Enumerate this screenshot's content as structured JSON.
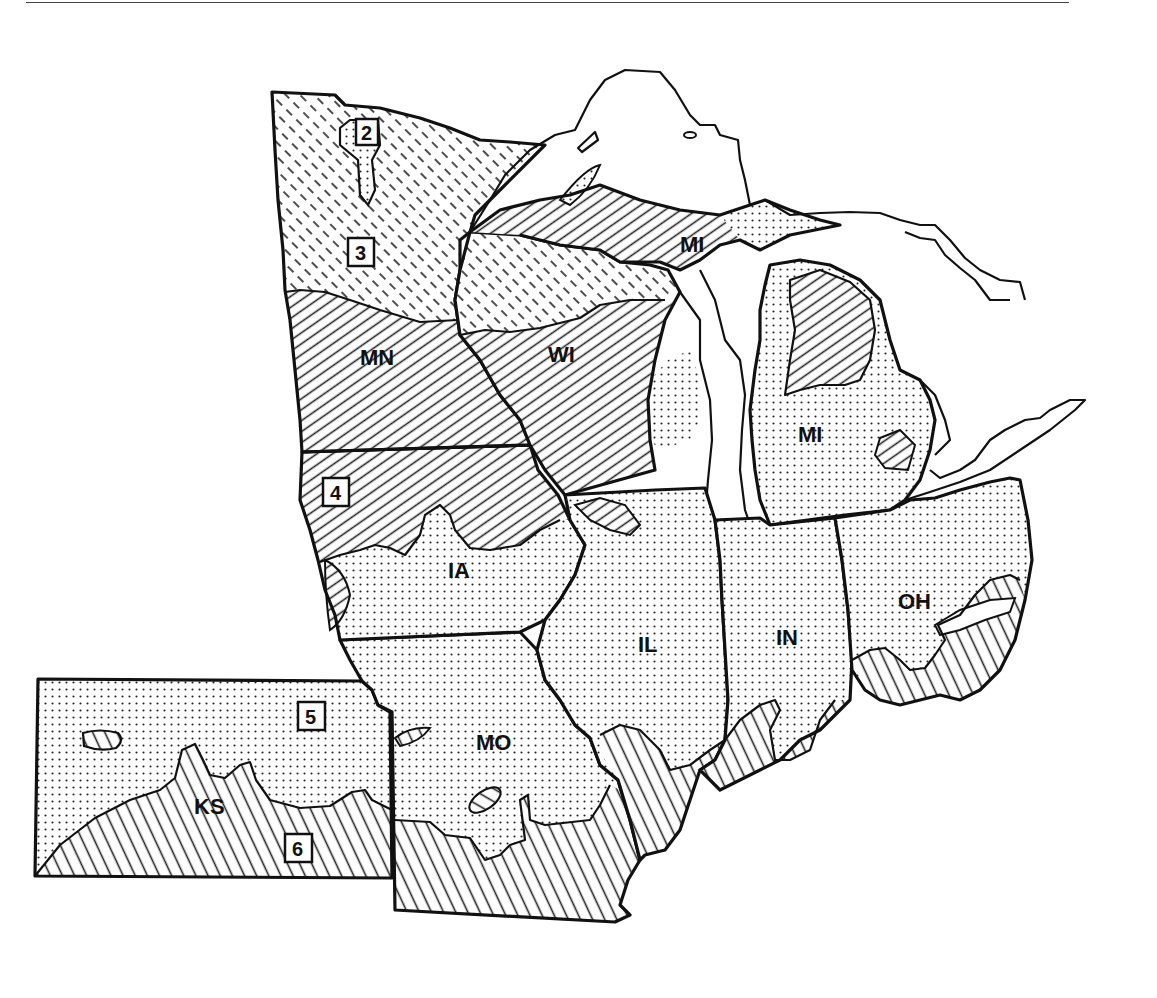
{
  "map": {
    "type": "regional zone map",
    "region": "Midwestern United States",
    "state_labels": [
      {
        "id": "MN",
        "text": "MN",
        "x": 382,
        "y": 365
      },
      {
        "id": "WI",
        "text": "WI",
        "x": 565,
        "y": 362
      },
      {
        "id": "MI_UP",
        "text": "MI",
        "x": 694,
        "y": 250
      },
      {
        "id": "MI",
        "text": "MI",
        "x": 812,
        "y": 440
      },
      {
        "id": "IA",
        "text": "IA",
        "x": 462,
        "y": 576
      },
      {
        "id": "IL",
        "text": "IL",
        "x": 650,
        "y": 650
      },
      {
        "id": "IN",
        "text": "IN",
        "x": 790,
        "y": 643
      },
      {
        "id": "OH",
        "text": "OH",
        "x": 917,
        "y": 607
      },
      {
        "id": "MO",
        "text": "MO",
        "x": 496,
        "y": 747
      },
      {
        "id": "KS",
        "text": "KS",
        "x": 212,
        "y": 812
      }
    ],
    "zone_labels": [
      {
        "num": "2",
        "x": 368,
        "y": 133
      },
      {
        "num": "3",
        "x": 362,
        "y": 253
      },
      {
        "num": "4",
        "x": 336,
        "y": 491
      },
      {
        "num": "5",
        "x": 311,
        "y": 716
      },
      {
        "num": "6",
        "x": 297,
        "y": 847
      }
    ],
    "patterns": [
      {
        "id": "dashed-hatch",
        "zone": "3",
        "description": "short dashed diagonal lines (northern MN / WI / UP)"
      },
      {
        "id": "fine-diagonal",
        "zone": "4",
        "description": "fine right-leaning diagonal lines (MN, WI, IA north, MI north)"
      },
      {
        "id": "dots",
        "zone": "5",
        "description": "stippled dots (IA, IL, IN, OH, MO, KS north, lower MI)"
      },
      {
        "id": "vertical-hatch",
        "zone": "6",
        "description": "steep left-leaning lines (KS south, MO south, IL/IN/OH south)"
      }
    ]
  }
}
